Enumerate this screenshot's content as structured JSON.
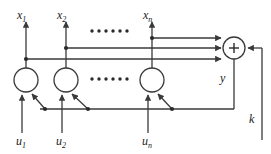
{
  "diagram": {
    "colors": {
      "line": "#3a3a3a",
      "text": "#1a1a1a",
      "background": "#ffffff"
    },
    "state_outputs": [
      {
        "id": "x1",
        "base": "x",
        "sub": "1",
        "x": 22,
        "y": 16
      },
      {
        "id": "x2",
        "base": "x",
        "sub": "2",
        "x": 62,
        "y": 16
      },
      {
        "id": "xn",
        "base": "x",
        "sub": "n",
        "x": 148,
        "y": 16
      }
    ],
    "inputs": [
      {
        "id": "u1",
        "base": "u",
        "sub": "1",
        "x": 22,
        "y": 141
      },
      {
        "id": "u2",
        "base": "u",
        "sub": "2",
        "x": 62,
        "y": 141
      },
      {
        "id": "un",
        "base": "u",
        "sub": "n",
        "x": 148,
        "y": 141
      }
    ],
    "sum_node": {
      "symbol": "+",
      "cx": 234,
      "cy": 48,
      "r": 11
    },
    "output_label": {
      "id": "y",
      "text": "y",
      "x": 222,
      "y": 83
    },
    "feedback_label": {
      "id": "k",
      "text": "k",
      "x": 249,
      "y": 123
    },
    "ellipsis_top": {
      "count": 6,
      "x": 92,
      "y": 31
    },
    "ellipsis_middle": {
      "count": 6,
      "x": 92,
      "y": 77
    },
    "neurons": [
      {
        "id": "neuron-1",
        "cx": 26,
        "cy": 80,
        "r": 12
      },
      {
        "id": "neuron-2",
        "cx": 66,
        "cy": 80,
        "r": 12
      },
      {
        "id": "neuron-n",
        "cx": 152,
        "cy": 80,
        "r": 12
      }
    ]
  }
}
